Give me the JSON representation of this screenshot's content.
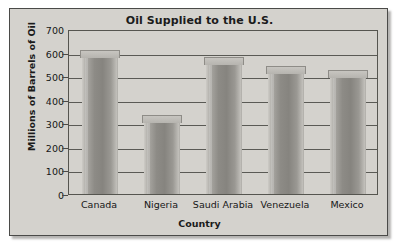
{
  "chart_data": {
    "type": "bar",
    "title": "Oil Supplied to the U.S.",
    "xlabel": "Country",
    "ylabel": "Millions of Barrels of Oil",
    "categories": [
      "Canada",
      "Nigeria",
      "Saudi Arabia",
      "Venezuela",
      "Mexico"
    ],
    "values": [
      580,
      305,
      550,
      512,
      495
    ],
    "ylim": [
      0,
      700
    ],
    "ytick_step": 100,
    "yticks": [
      0,
      100,
      200,
      300,
      400,
      500,
      600,
      700
    ],
    "ytick_labels": [
      "0",
      "100",
      "200",
      "300",
      "400",
      "500",
      "600",
      "700"
    ],
    "grid": true,
    "grid_axis": "y",
    "legend": null,
    "legend_position": "none",
    "series": [
      {
        "name": "Oil Supplied",
        "values": [
          580,
          305,
          550,
          512,
          495
        ]
      }
    ],
    "style": {
      "panel_background": "#d4d2cd",
      "plot_background": "#d4d2cd",
      "bar_fill": "#8d8b86",
      "bar_edge": "#8e8c87",
      "axis_color": "#4a4a48",
      "grid_color": "#5a5a55",
      "text_color": "#161616",
      "figure_background": "#ffffff"
    }
  }
}
